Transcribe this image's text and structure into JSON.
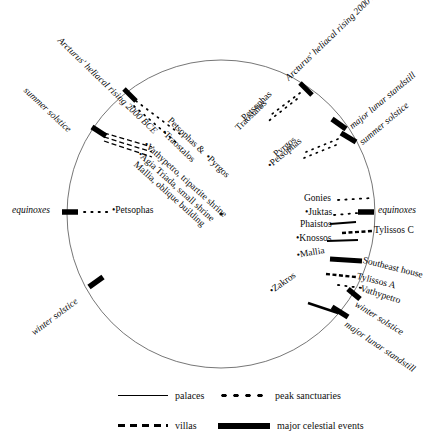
{
  "figure": {
    "type": "diagram",
    "center_marker": "center-dot"
  },
  "circle": {
    "cx": 221,
    "cy": 214,
    "r": 154
  },
  "celestial_events": [
    {
      "id": "arcturus-ul",
      "label": "Arcturus' heliacal rising 2000 BCE",
      "style": "italic"
    },
    {
      "id": "summer-solstice-ul",
      "label": "summer solstice",
      "style": "italic"
    },
    {
      "id": "equinoxes-left",
      "label": "equinoxes",
      "style": "italic"
    },
    {
      "id": "winter-solstice-ll",
      "label": "winter solstice",
      "style": "italic"
    },
    {
      "id": "arcturus-ur",
      "label": "Arcturus' heliacal rising 2000 BCE",
      "style": "italic"
    },
    {
      "id": "major-lunar-standstill-ur",
      "label": "major lunar standstill",
      "style": "italic"
    },
    {
      "id": "summer-solstice-ur",
      "label": "summer solstice",
      "style": "italic"
    },
    {
      "id": "equinoxes-right",
      "label": "equinoxes",
      "style": "italic"
    },
    {
      "id": "winter-solstice-lr",
      "label": "winter solstice",
      "style": "italic"
    },
    {
      "id": "major-lunar-standstill-lr",
      "label": "major lunar standstill",
      "style": "italic"
    }
  ],
  "site_labels_upper_left": [
    {
      "id": "petsophas-traostalos",
      "line1": "Petsophas &",
      "line2": "Traostalos",
      "extra": "Pyrgos"
    },
    {
      "id": "vathypetro",
      "label": "Vathypetro, tripartite shrine"
    },
    {
      "id": "agia-triada",
      "label": "Agia Triada, small shrine"
    },
    {
      "id": "mallia-oblique",
      "label": "Mallia, oblique building"
    }
  ],
  "site_labels_left": [
    {
      "id": "petsophas-left",
      "label": "Petsophas"
    }
  ],
  "site_labels_upper_right": [
    {
      "id": "petsophas-ur",
      "label": "Petsophas"
    },
    {
      "id": "traostalos-ur",
      "label": "Traostalos"
    },
    {
      "id": "pyrgos-ur",
      "label": "Pyrgos"
    },
    {
      "id": "petsophas-ur2",
      "label": "Petsophas"
    }
  ],
  "site_labels_right_inner": [
    {
      "id": "gonies",
      "label": "Gonies",
      "kind": "peak sanctuary"
    },
    {
      "id": "juktas",
      "label": "Juktas",
      "kind": "peak sanctuary"
    },
    {
      "id": "phaistos",
      "label": "Phaistos",
      "kind": "palace"
    },
    {
      "id": "knossos",
      "label": "Knossos",
      "kind": "palace"
    },
    {
      "id": "mallia",
      "label": "Mallia",
      "kind": "palace"
    },
    {
      "id": "zakros",
      "label": "Zakros",
      "kind": "palace"
    }
  ],
  "site_labels_right_outer": [
    {
      "id": "tylissos-c",
      "label": "Tylissos C",
      "kind": "villa"
    },
    {
      "id": "southeast-house",
      "label": "Southeast house",
      "kind": "major celestial event"
    },
    {
      "id": "tylissos-a",
      "label": "Tylissos A",
      "kind": "villa"
    },
    {
      "id": "vathypetro-r",
      "label": "Vathypetro",
      "kind": "peak sanctuary"
    }
  ],
  "legend": {
    "items": [
      {
        "id": "palaces",
        "label": "palaces",
        "swatch": "solid-line"
      },
      {
        "id": "peak-sanctuaries",
        "label": "peak sanctuaries",
        "swatch": "dotted-line"
      },
      {
        "id": "villas",
        "label": "villas",
        "swatch": "dashed-line"
      },
      {
        "id": "major-celestial-events",
        "label": "major celestial events",
        "swatch": "thick-bar"
      }
    ]
  },
  "colors": {
    "ink": "#0a0a0a",
    "arc": "#555555",
    "background": "#ffffff"
  }
}
